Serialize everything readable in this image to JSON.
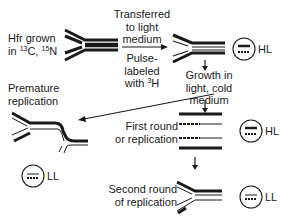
{
  "diagram": {
    "start": {
      "line1": "Hfr grown",
      "line2_prefix": "in ",
      "sup1": "13",
      "mid": "C, ",
      "sup2": "15",
      "end": "N"
    },
    "transfer": {
      "line1": "Transferred",
      "line2": "to light",
      "line3": "medium"
    },
    "pulse": {
      "line1": "Pulse-",
      "line2": "labeled",
      "line3_prefix": "with ",
      "sup": "3",
      "line3_end": "H"
    },
    "growth": {
      "line1": "Growth in",
      "line2": "light, cold",
      "line3": "medium"
    },
    "premature": {
      "line1": "Premature",
      "line2": "replication"
    },
    "first_round": {
      "line1": "First round",
      "line2": "or replication"
    },
    "second_round": {
      "line1": "Second round",
      "line2": "of replication"
    },
    "density_labels": {
      "hl_top": "HL",
      "hl_mid": "HL",
      "ll_left": "LL",
      "ll_bottom": "LL"
    },
    "colors": {
      "line": "#1a1a1a",
      "background": "#ffffff"
    }
  }
}
